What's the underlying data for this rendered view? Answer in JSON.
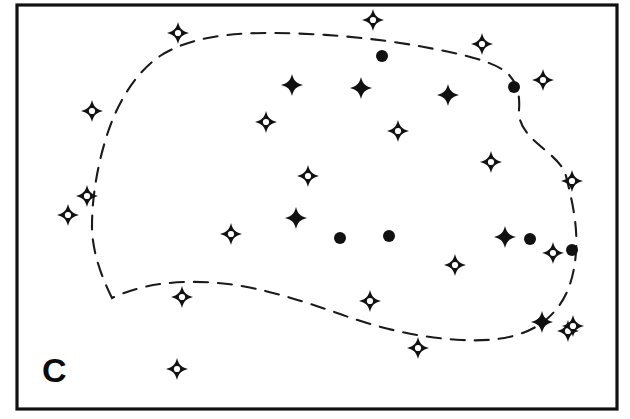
{
  "figure": {
    "panel_label": "C",
    "panel_label_position": {
      "x": 42,
      "y": 382
    },
    "background_color": "#ffffff",
    "ink_color": "#111111",
    "frame": {
      "name": "plot-border",
      "x": 17,
      "y": 5,
      "width": 600,
      "height": 404,
      "stroke_color": "#111111",
      "stroke_width": 3.2
    },
    "boundary": {
      "name": "dashed-cluster-outline",
      "style": "hand-drawn dashed closed curve",
      "stroke_color": "#1a1a1a",
      "stroke_width": 2.1,
      "dash_pattern": "14 10",
      "path": "M 112 298 C 102 278 92 252 92 226 C 92 196 98 162 108 132 C 118 102 136 72 160 56 C 188 38 226 33 268 33 C 320 33 376 38 424 47 C 462 54 492 61 506 72 C 518 82 520 96 519 110 C 517 140 560 152 566 176 C 572 200 578 226 576 252 C 574 280 566 302 548 318 C 528 336 498 342 462 340 C 420 338 378 328 340 314 C 300 300 262 288 228 284 C 194 280 162 282 140 288 C 126 292 118 295 112 298 Z"
    },
    "legend_semantics": {
      "filled_star": "filled four-pointed star marker",
      "open_star": "open four-pointed star marker",
      "filled_dot": "filled circular dot marker"
    },
    "markers": {
      "open_stars": [
        {
          "x": 178,
          "y": 33,
          "r": 11
        },
        {
          "x": 373,
          "y": 20,
          "r": 11
        },
        {
          "x": 482,
          "y": 44,
          "r": 11
        },
        {
          "x": 543,
          "y": 80,
          "r": 11
        },
        {
          "x": 266,
          "y": 122,
          "r": 11
        },
        {
          "x": 398,
          "y": 131,
          "r": 11
        },
        {
          "x": 92,
          "y": 111,
          "r": 11
        },
        {
          "x": 87,
          "y": 196,
          "r": 11
        },
        {
          "x": 68,
          "y": 215,
          "r": 11
        },
        {
          "x": 308,
          "y": 176,
          "r": 11
        },
        {
          "x": 491,
          "y": 162,
          "r": 11
        },
        {
          "x": 572,
          "y": 181,
          "r": 11
        },
        {
          "x": 231,
          "y": 234,
          "r": 11
        },
        {
          "x": 455,
          "y": 265,
          "r": 11
        },
        {
          "x": 553,
          "y": 253,
          "r": 11
        },
        {
          "x": 182,
          "y": 297,
          "r": 11
        },
        {
          "x": 370,
          "y": 301,
          "r": 11
        },
        {
          "x": 418,
          "y": 348,
          "r": 11
        },
        {
          "x": 177,
          "y": 369,
          "r": 11
        },
        {
          "x": 568,
          "y": 331,
          "r": 11
        },
        {
          "x": 573,
          "y": 326,
          "r": 11
        }
      ],
      "filled_stars": [
        {
          "x": 292,
          "y": 85,
          "r": 11
        },
        {
          "x": 361,
          "y": 88,
          "r": 11
        },
        {
          "x": 448,
          "y": 95,
          "r": 11
        },
        {
          "x": 296,
          "y": 218,
          "r": 11
        },
        {
          "x": 505,
          "y": 237,
          "r": 11
        },
        {
          "x": 542,
          "y": 322,
          "r": 11
        }
      ],
      "filled_dots": [
        {
          "x": 382,
          "y": 56,
          "r": 6
        },
        {
          "x": 514,
          "y": 87,
          "r": 6
        },
        {
          "x": 340,
          "y": 238,
          "r": 6
        },
        {
          "x": 389,
          "y": 236,
          "r": 6
        },
        {
          "x": 530,
          "y": 239,
          "r": 6
        },
        {
          "x": 572,
          "y": 250,
          "r": 6
        }
      ]
    },
    "counts": {
      "open_stars": 21,
      "filled_stars": 6,
      "filled_dots": 6
    }
  }
}
